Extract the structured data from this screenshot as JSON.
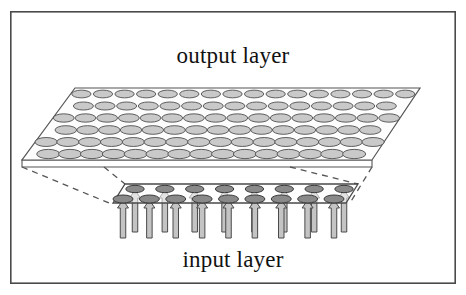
{
  "figure": {
    "title_top": "output layer",
    "title_bottom": "input layer",
    "frame": {
      "x": 10,
      "y": 11,
      "width": 446,
      "height": 273,
      "stroke": "#4a4a4a",
      "stroke_width": 1.6,
      "fill": "#ffffff"
    },
    "colors": {
      "background": "#ffffff",
      "frame_border": "#4a4a4a",
      "output_plane_fill": "#fdfdfd",
      "output_plane_stroke": "#555555",
      "output_node_fill": "#c9c9c9",
      "output_node_stroke": "#4f4f4f",
      "input_plane_fill": "#fefefe",
      "input_plane_stroke": "#4a4a4a",
      "input_node_fill": "#8a8a8a",
      "input_node_stroke": "#3a3a3a",
      "arrow_fill": "#c4c4c4",
      "arrow_stroke": "#4a4a4a",
      "dashed_line": "#555555",
      "text": "#111111"
    }
  },
  "output_layer": {
    "name": "output layer",
    "label_x": 233,
    "label_y": 62,
    "plane": {
      "top_left_x": 75,
      "top_right_x": 420,
      "bottom_left_x": 22,
      "bottom_right_x": 372,
      "top_y": 88,
      "bottom_y": 160,
      "edge_depth": 7
    },
    "node_rows": 6,
    "node_cols": 16,
    "node_rx": 10.5,
    "node_ry": 4.2,
    "node_count": 96,
    "stagger": true
  },
  "input_layer": {
    "name": "input layer",
    "label_x": 233,
    "label_y": 262,
    "plane": {
      "top_left_x": 125,
      "top_right_x": 358,
      "bottom_left_x": 113,
      "bottom_right_x": 346,
      "top_y": 184,
      "bottom_y": 203,
      "edge_depth": 4
    },
    "node_rows": 2,
    "back_row_count": 8,
    "front_row_count": 9,
    "node_rx": 10.0,
    "node_ry": 4.0,
    "node_count": 17,
    "arrows": {
      "count": 17,
      "shaft_width": 5.5,
      "head_width": 11.0,
      "head_height": 8.0,
      "tall_length": 38,
      "short_length": 28
    }
  },
  "connectors": {
    "style": "dashed",
    "dash_pattern": "6,5",
    "count": 4,
    "description": "dashed projection lines from output layer corners to input layer corners"
  }
}
